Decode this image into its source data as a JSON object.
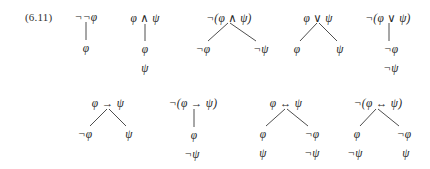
{
  "figure": {
    "equation_label": "(6.11)",
    "background_color": "#ffffff",
    "ink_color": "#262626",
    "symbols": {
      "negation": "¬",
      "conjunction": "∧",
      "disjunction": "∨",
      "conditional": "→",
      "biconditional": "↔",
      "phi": "φ",
      "psi": "ψ"
    },
    "trees": [
      {
        "name": "double-negation",
        "root": "¬¬φ",
        "nodes": [
          "φ"
        ],
        "branching": "linear"
      },
      {
        "name": "conjunction",
        "root": "φ ∧ ψ",
        "nodes": [
          "φ",
          "ψ"
        ],
        "branching": "linear"
      },
      {
        "name": "negated-conjunction",
        "root": "¬(φ ∧ ψ)",
        "left": [
          "¬φ"
        ],
        "right": [
          "¬ψ"
        ],
        "branching": "split"
      },
      {
        "name": "disjunction",
        "root": "φ ∨ ψ",
        "left": [
          "φ"
        ],
        "right": [
          "ψ"
        ],
        "branching": "split"
      },
      {
        "name": "negated-disjunction",
        "root": "¬(φ ∨ ψ)",
        "nodes": [
          "¬φ",
          "¬ψ"
        ],
        "branching": "linear"
      },
      {
        "name": "conditional",
        "root": "φ → ψ",
        "left": [
          "¬φ"
        ],
        "right": [
          "ψ"
        ],
        "branching": "split"
      },
      {
        "name": "negated-conditional",
        "root": "¬(φ → ψ)",
        "nodes": [
          "φ",
          "¬ψ"
        ],
        "branching": "linear"
      },
      {
        "name": "biconditional",
        "root": "φ ↔ ψ",
        "left": [
          "φ",
          "ψ"
        ],
        "right": [
          "¬φ",
          "¬ψ"
        ],
        "branching": "split"
      },
      {
        "name": "negated-biconditional",
        "root": "¬(φ ↔ ψ)",
        "left": [
          "φ",
          "¬ψ"
        ],
        "right": [
          "¬φ",
          "ψ"
        ],
        "branching": "split"
      }
    ]
  }
}
